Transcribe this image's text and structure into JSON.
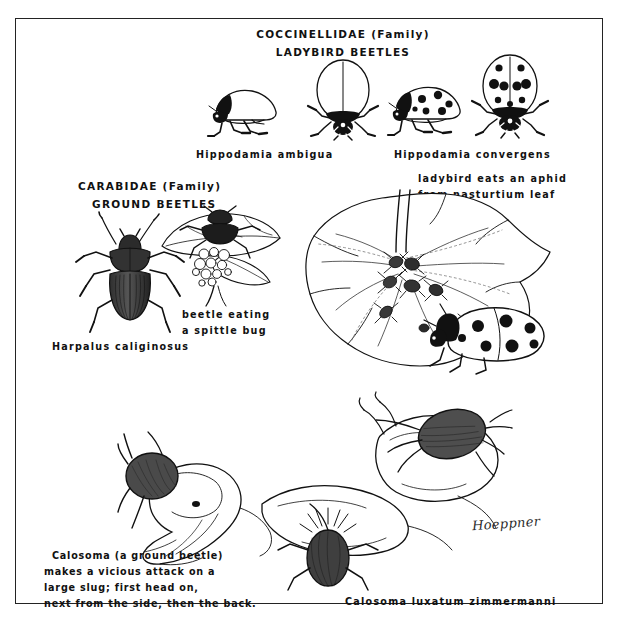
{
  "plate": {
    "title_family_top": "COCCINELLIDAE (Family)",
    "title_common_top": "LADYBIRD  BEETLES",
    "title_family_left": "CARABIDAE (Family)",
    "title_common_left": "GROUND  BEETLES",
    "signature": "Hoeppner",
    "border_color": "#232323",
    "ink_color": "#111111",
    "paper_color": "#ffffff"
  },
  "labels": {
    "ladybird_ambigua": "Hippodamia  ambigua",
    "ladybird_convergens": "Hippodamia   convergens",
    "harpalus": "Harpalus  caliginosus",
    "spittle_line1": "beetle eating",
    "spittle_line2": "a  spittle bug",
    "aphid_line1": "ladybird eats an aphid",
    "aphid_line2": "from  nasturtium  leaf",
    "calosoma_species": "Calosoma  luxatum  zimmermanni",
    "calosoma_note_line1": "Calosoma  (a ground  beetle)",
    "calosoma_note_line2": "makes a vicious  attack on a",
    "calosoma_note_line3": "large  slug;   first    head   on,",
    "calosoma_note_line4": "next from  the side,  then  the back."
  },
  "figures": {
    "ladybird_side_plain": "hippodamia-ambigua-lateral",
    "ladybird_dorsal_plain": "hippodamia-ambigua-dorsal",
    "ladybird_side_spotted": "hippodamia-convergens-lateral",
    "ladybird_dorsal_spotted": "hippodamia-convergens-dorsal",
    "ground_beetle_dorsal": "harpalus-caliginosus-dorsal",
    "spittle_bug_scene": "beetle-eating-spittle-bug",
    "nasturtium_scene": "ladybird-eating-aphids-on-nasturtium-leaf",
    "slug_head_on": "calosoma-attacking-slug-head-on",
    "slug_side": "calosoma-attacking-slug-from-side",
    "slug_back": "calosoma-attacking-slug-from-back"
  }
}
